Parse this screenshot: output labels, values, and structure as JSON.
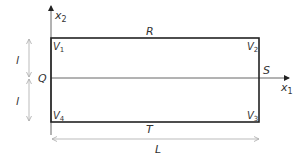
{
  "diagram": {
    "axes": {
      "horizontal_label": "x",
      "horizontal_sub": "1",
      "vertical_label": "x",
      "vertical_sub": "2"
    },
    "sides": {
      "top": "R",
      "right": "S",
      "bottom": "T",
      "left": "Q"
    },
    "vertices": [
      {
        "name": "V",
        "sub": "1",
        "position": "top-left"
      },
      {
        "name": "V",
        "sub": "2",
        "position": "top-right"
      },
      {
        "name": "V",
        "sub": "3",
        "position": "bottom-right"
      },
      {
        "name": "V",
        "sub": "4",
        "position": "bottom-left"
      }
    ],
    "dimensions": {
      "half_height_upper": "l",
      "half_height_lower": "l",
      "length": "L"
    },
    "colors": {
      "rectangle": "#222222",
      "axis": "#555555",
      "dimension_arrow": "#aaaaaa",
      "text": "#333333"
    }
  }
}
